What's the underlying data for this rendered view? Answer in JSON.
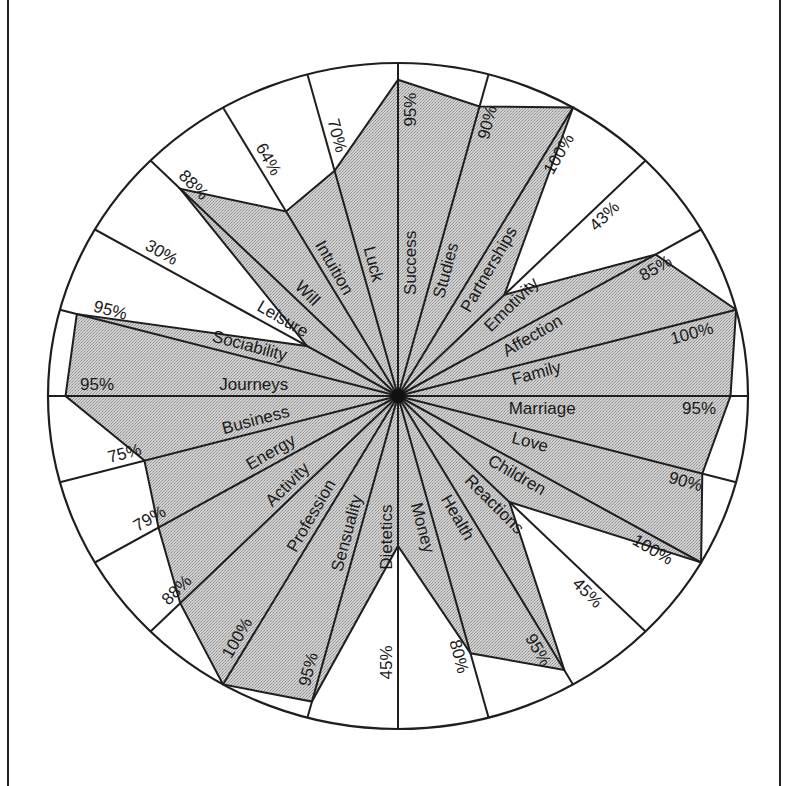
{
  "chart_data": {
    "type": "radar",
    "title": "",
    "value_unit": "%",
    "range": [
      0,
      100
    ],
    "grid": false,
    "legend": null,
    "direction": "clockwise from top",
    "categories": [
      "Success",
      "Studies",
      "Partnerships",
      "Emotivity",
      "Affection",
      "Family",
      "Marriage",
      "Love",
      "Children",
      "Reactions",
      "Health",
      "Money",
      "Dietetics",
      "Sensuality",
      "Profession",
      "Activity",
      "Energy",
      "Business",
      "Journeys",
      "Sociability",
      "Leisure",
      "Will",
      "Intuition",
      "Luck"
    ],
    "values": [
      95,
      90,
      100,
      43,
      85,
      100,
      95,
      90,
      100,
      45,
      95,
      80,
      45,
      95,
      100,
      88,
      79,
      75,
      95,
      95,
      30,
      88,
      64,
      70
    ],
    "value_labels": [
      "95%",
      "90%",
      "100%",
      "43%",
      "85%",
      "100%",
      "95%",
      "90%",
      "100%",
      "45%",
      "95%",
      "80%",
      "45%",
      "95%",
      "100%",
      "88%",
      "79%",
      "75%",
      "95%",
      "95%",
      "30%",
      "88%",
      "64%",
      "70%"
    ]
  },
  "style": {
    "fill_color": "#c9c9c9",
    "line_color": "#1e1e1e",
    "background": "#ffffff"
  }
}
